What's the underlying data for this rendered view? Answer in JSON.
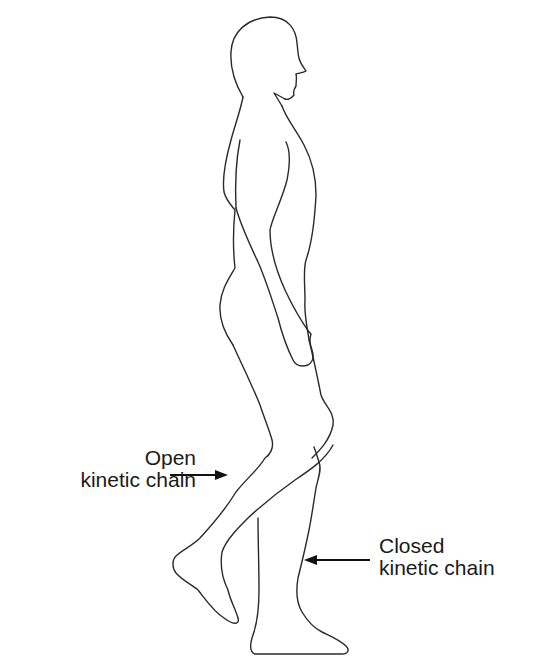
{
  "diagram": {
    "labels": {
      "open_chain": {
        "line1": "Open",
        "line2": "kinetic chain",
        "points_to": "swinging leg"
      },
      "closed_chain": {
        "line1": "Closed",
        "line2": "kinetic chain",
        "points_to": "weight-bearing leg"
      }
    },
    "colors": {
      "background": "#ffffff",
      "outline": "#2a2a2a",
      "text": "#1a1a1a",
      "arrow": "#111111"
    }
  }
}
